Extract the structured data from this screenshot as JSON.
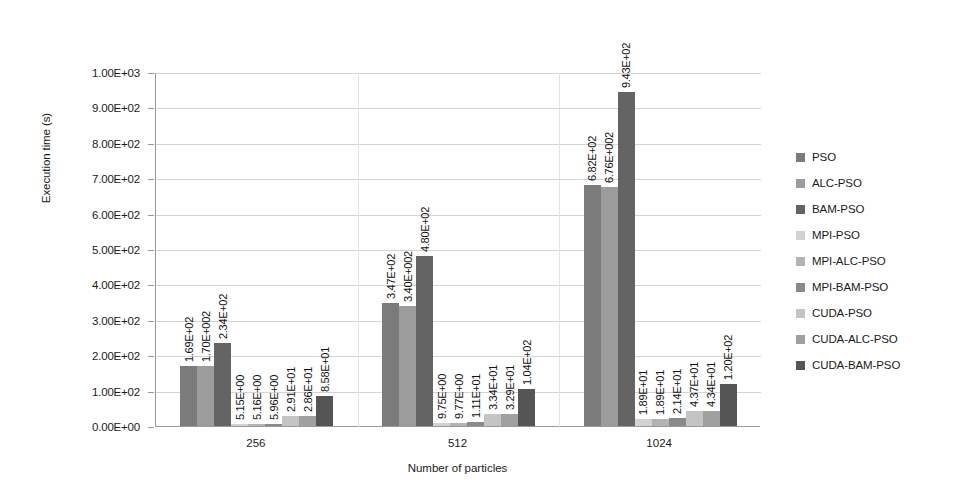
{
  "chart_data": {
    "type": "bar",
    "title": "",
    "xlabel": "Number of particles",
    "ylabel": "Execution time (s)",
    "categories": [
      "256",
      "512",
      "1024"
    ],
    "ylim": [
      0,
      1000
    ],
    "ytick_labels": [
      "0.00E+00",
      "1.00E+02",
      "2.00E+02",
      "3.00E+02",
      "4.00E+02",
      "5.00E+02",
      "6.00E+02",
      "7.00E+02",
      "8.00E+02",
      "9.00E+02",
      "1.00E+03"
    ],
    "ytick_values": [
      0,
      100,
      200,
      300,
      400,
      500,
      600,
      700,
      800,
      900,
      1000
    ],
    "grid": true,
    "legend_position": "right",
    "series": [
      {
        "name": "PSO",
        "color": "#7b7b7b",
        "values": [
          169.0,
          347.0,
          682.0
        ],
        "labels": [
          "1.69E+02",
          "3.47E+02",
          "6.82E+02"
        ]
      },
      {
        "name": "ALC-PSO",
        "color": "#9c9c9c",
        "values": [
          170.0,
          340.0,
          676.0
        ],
        "labels": [
          "1.70E+002",
          "3.40E+002",
          "6.76E+002"
        ]
      },
      {
        "name": "BAM-PSO",
        "color": "#646464",
        "values": [
          234.0,
          480.0,
          943.0
        ],
        "labels": [
          "2.34E+02",
          "4.80E+02",
          "9.43E+02"
        ]
      },
      {
        "name": "MPI-PSO",
        "color": "#d2d2d2",
        "values": [
          5.15,
          9.75,
          18.9
        ],
        "labels": [
          "5.15E+00",
          "9.75E+00",
          "1.89E+01"
        ]
      },
      {
        "name": "MPI-ALC-PSO",
        "color": "#b3b3b3",
        "values": [
          5.16,
          9.77,
          18.9
        ],
        "labels": [
          "5.16E+00",
          "9.77E+00",
          "1.89E+01"
        ]
      },
      {
        "name": "MPI-BAM-PSO",
        "color": "#8a8a8a",
        "values": [
          5.96,
          11.1,
          21.4
        ],
        "labels": [
          "5.96E+00",
          "1.11E+01",
          "2.14E+01"
        ]
      },
      {
        "name": "CUDA-PSO",
        "color": "#c4c4c4",
        "values": [
          29.1,
          33.4,
          43.7
        ],
        "labels": [
          "2.91E+01",
          "3.34E+01",
          "4.37E+01"
        ]
      },
      {
        "name": "CUDA-ALC-PSO",
        "color": "#a0a0a0",
        "values": [
          28.6,
          32.9,
          43.4
        ],
        "labels": [
          "2.86E+01",
          "3.29E+01",
          "4.34E+01"
        ]
      },
      {
        "name": "CUDA-BAM-PSO",
        "color": "#555555",
        "values": [
          85.8,
          104.0,
          120.0
        ],
        "labels": [
          "8.58E+01",
          "1.04E+02",
          "1.20E+02"
        ]
      }
    ]
  }
}
